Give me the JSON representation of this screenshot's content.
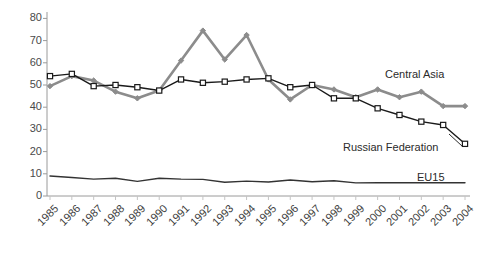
{
  "chart_data": {
    "type": "line",
    "title": "",
    "subtitle": "",
    "xlabel": "",
    "ylabel": "",
    "ylim": [
      0,
      80
    ],
    "ytick_values": [
      0,
      10,
      20,
      30,
      40,
      50,
      60,
      70,
      80
    ],
    "ytick_labels": [
      "0",
      "10",
      "20",
      "30",
      "40",
      "50",
      "60",
      "70",
      "80"
    ],
    "grid": false,
    "legend_position": "inline-annotations",
    "categories": [
      "1985",
      "1986",
      "1987",
      "1988",
      "1989",
      "1990",
      "1991",
      "1992",
      "1993",
      "1994",
      "1995",
      "1996",
      "1997",
      "1998",
      "1999",
      "2000",
      "2001",
      "2002",
      "2003",
      "2004"
    ],
    "series": [
      {
        "name": "Central Asia",
        "color": "#8c8c8c",
        "marker": "diamond",
        "values": [
          49.5,
          54.0,
          52.0,
          47.0,
          44.0,
          47.5,
          61.0,
          74.5,
          61.5,
          72.5,
          52.5,
          43.5,
          50.0,
          48.0,
          44.5,
          48.0,
          44.5,
          47.0,
          40.5,
          40.5
        ]
      },
      {
        "name": "Russian Federation",
        "color": "#1a1a1a",
        "marker": "square",
        "values": [
          54.0,
          55.0,
          49.5,
          50.0,
          49.0,
          47.5,
          52.5,
          51.0,
          51.5,
          52.5,
          53.0,
          49.0,
          50.0,
          44.0,
          44.0,
          39.5,
          36.5,
          33.5,
          32.0,
          23.5
        ]
      },
      {
        "name": "EU15",
        "color": "#333333",
        "marker": "none",
        "values": [
          9.0,
          8.3,
          7.6,
          8.0,
          6.6,
          8.0,
          7.6,
          7.5,
          6.2,
          6.7,
          6.3,
          7.2,
          6.4,
          6.9,
          5.9,
          6.0,
          6.0,
          6.0,
          6.0,
          6.0
        ]
      }
    ],
    "annotations": [
      {
        "text": "Central Asia",
        "x_px": 385,
        "y_px": 68
      },
      {
        "text": "Russian Federation",
        "x_px": 343,
        "y_px": 141
      },
      {
        "text": "EU15",
        "x_px": 417,
        "y_px": 171
      }
    ]
  }
}
